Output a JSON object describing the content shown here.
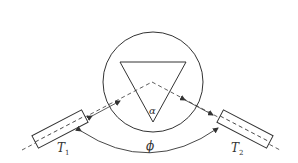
{
  "diagram": {
    "labels": {
      "t1": "T",
      "t1_sub": "1",
      "t2": "T",
      "t2_sub": "2",
      "alpha": "α",
      "phi": "ϕ"
    },
    "colors": {
      "stroke": "#333333",
      "background": "#ffffff"
    }
  }
}
